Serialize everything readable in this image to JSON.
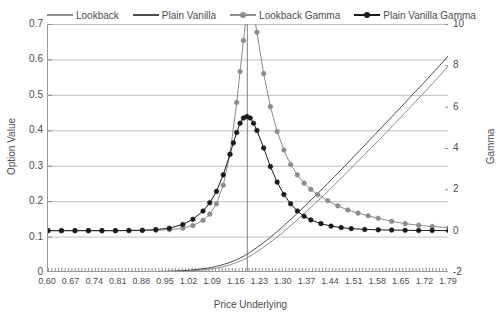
{
  "chart_data": {
    "type": "line",
    "title": "",
    "xlabel": "Price Underlying",
    "ylabel": "Option Value",
    "ylabel_secondary": "Gamma",
    "grid": true,
    "legend_position": "top",
    "xlim": [
      0.6,
      1.79
    ],
    "ylim": [
      0,
      0.7
    ],
    "ylim_secondary": [
      -2,
      10
    ],
    "x_tick_labels": [
      "0.60",
      "0.67",
      "0.74",
      "0.81",
      "0.88",
      "0.95",
      "1.02",
      "1.09",
      "1.16",
      "1.23",
      "1.30",
      "1.37",
      "1.44",
      "1.51",
      "1.58",
      "1.65",
      "1.72",
      "1.79"
    ],
    "x_tick_values": [
      0.6,
      0.67,
      0.74,
      0.81,
      0.88,
      0.95,
      1.02,
      1.09,
      1.16,
      1.23,
      1.3,
      1.37,
      1.44,
      1.51,
      1.58,
      1.65,
      1.72,
      1.79
    ],
    "y_tick_labels": [
      "0",
      "0.1",
      "0.2",
      "0.3",
      "0.4",
      "0.5",
      "0.6",
      "0.7"
    ],
    "y_tick_values": [
      0,
      0.1,
      0.2,
      0.3,
      0.4,
      0.5,
      0.6,
      0.7
    ],
    "y2_tick_labels": [
      "-2",
      "0",
      "2",
      "4",
      "6",
      "8",
      "10"
    ],
    "y2_tick_values": [
      -2,
      0,
      2,
      4,
      6,
      8,
      10
    ],
    "strike_line_x": 1.19,
    "series": [
      {
        "name": "Lookback",
        "axis": "left",
        "color": "#8c8c8c",
        "marker": "none",
        "x": [
          0.6,
          0.65,
          0.7,
          0.75,
          0.8,
          0.85,
          0.9,
          0.95,
          1.0,
          1.02,
          1.05,
          1.08,
          1.1,
          1.12,
          1.14,
          1.16,
          1.18,
          1.19,
          1.2,
          1.22,
          1.24,
          1.26,
          1.28,
          1.3,
          1.33,
          1.36,
          1.39,
          1.42,
          1.45,
          1.48,
          1.51,
          1.54,
          1.57,
          1.6,
          1.63,
          1.66,
          1.69,
          1.72,
          1.75,
          1.79
        ],
        "y": [
          0.0,
          0.0,
          0.0,
          0.0,
          0.0,
          0.0,
          0.001,
          0.001,
          0.002,
          0.003,
          0.005,
          0.008,
          0.011,
          0.015,
          0.02,
          0.027,
          0.035,
          0.04,
          0.045,
          0.057,
          0.07,
          0.084,
          0.099,
          0.114,
          0.139,
          0.165,
          0.191,
          0.218,
          0.246,
          0.274,
          0.303,
          0.332,
          0.361,
          0.39,
          0.42,
          0.45,
          0.48,
          0.51,
          0.541,
          0.583
        ]
      },
      {
        "name": "Plain Vanilla",
        "axis": "left",
        "color": "#4d4d4d",
        "marker": "none",
        "x": [
          0.6,
          0.65,
          0.7,
          0.75,
          0.8,
          0.85,
          0.9,
          0.95,
          1.0,
          1.02,
          1.05,
          1.08,
          1.1,
          1.12,
          1.14,
          1.16,
          1.18,
          1.19,
          1.2,
          1.22,
          1.24,
          1.26,
          1.28,
          1.3,
          1.33,
          1.36,
          1.39,
          1.42,
          1.45,
          1.48,
          1.51,
          1.54,
          1.57,
          1.6,
          1.63,
          1.66,
          1.69,
          1.72,
          1.75,
          1.79
        ],
        "y": [
          0.0,
          0.0,
          0.0,
          0.0,
          0.0,
          0.0,
          0.001,
          0.002,
          0.004,
          0.005,
          0.008,
          0.012,
          0.016,
          0.021,
          0.027,
          0.035,
          0.044,
          0.05,
          0.056,
          0.069,
          0.083,
          0.098,
          0.114,
          0.131,
          0.157,
          0.184,
          0.212,
          0.24,
          0.269,
          0.298,
          0.328,
          0.358,
          0.388,
          0.418,
          0.448,
          0.478,
          0.509,
          0.539,
          0.57,
          0.612
        ]
      },
      {
        "name": "Lookback Gamma",
        "axis": "right",
        "color": "#8c8c8c",
        "marker": "circle",
        "x": [
          0.6,
          0.64,
          0.68,
          0.72,
          0.76,
          0.8,
          0.84,
          0.88,
          0.92,
          0.96,
          1.0,
          1.03,
          1.06,
          1.08,
          1.1,
          1.12,
          1.14,
          1.16,
          1.17,
          1.18,
          1.19,
          1.2,
          1.21,
          1.22,
          1.24,
          1.26,
          1.28,
          1.3,
          1.32,
          1.34,
          1.36,
          1.38,
          1.4,
          1.43,
          1.46,
          1.49,
          1.52,
          1.55,
          1.58,
          1.62,
          1.66,
          1.7,
          1.74,
          1.79
        ],
        "y": [
          0.0,
          0.0,
          0.0,
          0.0,
          0.0,
          0.0,
          0.0,
          0.01,
          0.02,
          0.05,
          0.12,
          0.25,
          0.5,
          0.8,
          1.3,
          2.2,
          3.7,
          6.2,
          7.7,
          9.2,
          10.6,
          11.3,
          10.6,
          9.6,
          7.6,
          6.0,
          4.8,
          3.9,
          3.2,
          2.7,
          2.3,
          2.0,
          1.75,
          1.45,
          1.2,
          1.0,
          0.85,
          0.72,
          0.6,
          0.45,
          0.34,
          0.26,
          0.2,
          0.14
        ]
      },
      {
        "name": "Plain Vanilla Gamma",
        "axis": "right",
        "color": "#1a1a1a",
        "marker": "circle",
        "x": [
          0.6,
          0.64,
          0.68,
          0.72,
          0.76,
          0.8,
          0.84,
          0.88,
          0.92,
          0.96,
          1.0,
          1.03,
          1.06,
          1.08,
          1.1,
          1.12,
          1.14,
          1.15,
          1.16,
          1.17,
          1.18,
          1.19,
          1.2,
          1.21,
          1.22,
          1.24,
          1.26,
          1.28,
          1.3,
          1.32,
          1.34,
          1.36,
          1.38,
          1.41,
          1.44,
          1.47,
          1.5,
          1.54,
          1.58,
          1.62,
          1.66,
          1.7,
          1.74,
          1.79
        ],
        "y": [
          0.0,
          0.0,
          0.0,
          0.0,
          0.0,
          0.0,
          0.01,
          0.02,
          0.05,
          0.12,
          0.3,
          0.55,
          0.95,
          1.35,
          1.9,
          2.7,
          3.7,
          4.25,
          4.75,
          5.2,
          5.45,
          5.52,
          5.45,
          5.2,
          4.85,
          4.0,
          3.1,
          2.35,
          1.75,
          1.3,
          0.95,
          0.7,
          0.52,
          0.34,
          0.22,
          0.15,
          0.1,
          0.06,
          0.04,
          0.03,
          0.02,
          0.01,
          0.01,
          0.0
        ]
      }
    ]
  },
  "legend": {
    "items": [
      {
        "label": "Lookback",
        "color": "#8c8c8c",
        "marker": false
      },
      {
        "label": "Plain Vanilla",
        "color": "#4d4d4d",
        "marker": false
      },
      {
        "label": "Lookback Gamma",
        "color": "#8c8c8c",
        "marker": true
      },
      {
        "label": "Plain Vanilla Gamma",
        "color": "#1a1a1a",
        "marker": true
      }
    ]
  },
  "axes": {
    "x_title": "Price Underlying",
    "y_title_left": "Option Value",
    "y_title_right": "Gamma"
  }
}
